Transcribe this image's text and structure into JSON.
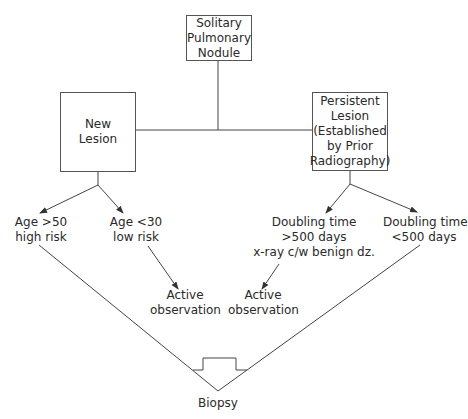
{
  "nodes": {
    "root": {
      "lines": [
        "Solitary",
        "Pulmonary",
        "Nodule"
      ]
    },
    "new_lesion": {
      "lines": [
        "New",
        "Lesion"
      ]
    },
    "persistent_lesion": {
      "lines": [
        "Persistent",
        "Lesion",
        "(Established",
        "by Prior",
        "Radiography)"
      ]
    },
    "age_over_50": {
      "lines": [
        "Age >50",
        "high risk"
      ]
    },
    "age_under_30": {
      "lines": [
        "Age <30",
        "low risk"
      ]
    },
    "doubling_over_500": {
      "lines": [
        "Doubling time",
        ">500 days",
        "x-ray c/w benign dz."
      ]
    },
    "doubling_under_500": {
      "lines": [
        "Doubling time",
        "<500 days"
      ]
    },
    "active_observation_left": {
      "lines": [
        "Active",
        "observation"
      ]
    },
    "active_observation_right": {
      "lines": [
        "Active",
        "observation"
      ]
    },
    "biopsy": {
      "lines": [
        "Biopsy"
      ]
    }
  },
  "colors": {
    "line": "#444444",
    "text": "#2a2a2a",
    "background": "#ffffff"
  }
}
